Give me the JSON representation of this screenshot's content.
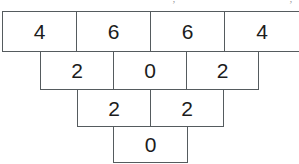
{
  "figure": {
    "name": "number-pyramid",
    "rows": [
      {
        "cells": [
          "4",
          "6",
          "6",
          "4"
        ]
      },
      {
        "cells": [
          "2",
          "0",
          "2"
        ]
      },
      {
        "cells": [
          "2",
          "2"
        ]
      },
      {
        "cells": [
          "0"
        ]
      }
    ],
    "colors": {
      "border": "#555b5e",
      "cell_background": "#ffffff",
      "digit": "#1c1c1c",
      "page_background": "#ffffff"
    }
  },
  "scan_artifacts": {
    "fragment_left": "’",
    "fragment_right": "’"
  }
}
